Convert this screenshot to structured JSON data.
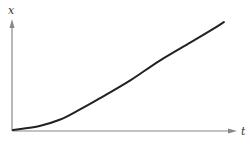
{
  "chart_data": {
    "type": "line",
    "title": "",
    "xlabel": "t",
    "ylabel": "x",
    "grid": false,
    "legend": null,
    "series": [
      {
        "name": "x(t)",
        "points": [
          [
            0.0,
            0.0
          ],
          [
            0.12,
            0.04
          ],
          [
            0.21,
            0.1
          ],
          [
            0.3,
            0.2
          ],
          [
            0.39,
            0.31
          ],
          [
            0.53,
            0.49
          ],
          [
            0.66,
            0.68
          ],
          [
            0.8,
            0.86
          ],
          [
            0.9,
            0.99
          ],
          [
            0.95,
            1.06
          ]
        ]
      }
    ],
    "xlim": [
      0,
      1
    ],
    "ylim": [
      0,
      1.1
    ]
  },
  "colors": {
    "axis": "#888888",
    "curve": "#222222",
    "label": "#333333"
  },
  "labels": {
    "y_axis": "x",
    "x_axis": "t"
  }
}
